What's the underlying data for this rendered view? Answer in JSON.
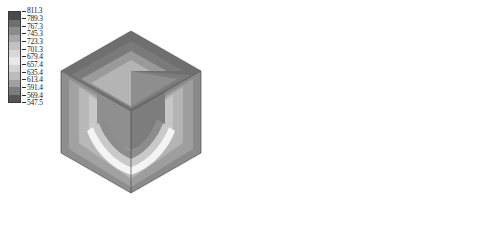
{
  "figure": {
    "kind": "fem-contour-cube-pair",
    "background": "#ffffff"
  },
  "panels": [
    {
      "id": "left",
      "name": "temperature-contour-cube",
      "colorbar": {
        "name": "temperature-colorbar",
        "orientation": "vertical",
        "labels": [
          "811.3",
          "789.3",
          "767.3",
          "745.3",
          "723.3",
          "701.3",
          "679.4",
          "657.4",
          "635.4",
          "613.4",
          "591.4",
          "569.4",
          "547.5"
        ],
        "swatches": [
          "#4a4a4a",
          "#6e6e6e",
          "#8c8c8c",
          "#a8a8a8",
          "#c2c2c2",
          "#d8d8d8",
          "#e8e8e8",
          "#d2d2d2",
          "#bcbcbc",
          "#a0a0a0",
          "#7c7c7c",
          "#565656"
        ],
        "min": "547.5",
        "max": "811.3"
      }
    },
    {
      "id": "right",
      "name": "stress-contour-cube",
      "colorbar": {
        "name": "stress-colorbar",
        "orientation": "vertical",
        "labels": [
          {
            "mantissa": "8.7",
            "exp": "7"
          },
          {
            "mantissa": "8.0",
            "exp": "7"
          },
          {
            "mantissa": "7.3",
            "exp": "7"
          },
          {
            "mantissa": "6.6",
            "exp": "7"
          },
          {
            "mantissa": "5.9",
            "exp": "7"
          },
          {
            "mantissa": "5.2",
            "exp": "7"
          },
          {
            "mantissa": "4.5",
            "exp": "7"
          },
          {
            "mantissa": "3.8",
            "exp": "7"
          },
          {
            "mantissa": "3.1",
            "exp": "7"
          },
          {
            "mantissa": "2.4",
            "exp": "7"
          },
          {
            "mantissa": "1.7",
            "exp": "7"
          },
          {
            "mantissa": "9.9",
            "exp": "6"
          },
          {
            "mantissa": "2.9",
            "exp": "6"
          }
        ],
        "multiply_symbol": "×",
        "base": "10",
        "swatches": [
          "#555555",
          "#767676",
          "#949494",
          "#aeaeae",
          "#c6c6c6",
          "#dcdcdc",
          "#ececec",
          "#d6d6d6",
          "#bdbdbd",
          "#9e9e9e",
          "#7a7a7a",
          "#5a5a5a"
        ],
        "min": "2.9",
        "max": "8.7"
      }
    }
  ],
  "chart_data": {
    "type": "heatmap",
    "title": "",
    "xlabel": "",
    "ylabel": "",
    "subplots": [
      {
        "name": "temperature-contour-cube",
        "geometry": "cube-with-octant-removed",
        "colormap": "grayscale-banded",
        "units_note": "",
        "legend_position": "upper-left",
        "levels": [
          547.5,
          569.4,
          591.4,
          613.4,
          635.4,
          657.4,
          679.4,
          701.3,
          723.3,
          745.3,
          767.3,
          789.3,
          811.3
        ],
        "range": [
          547.5,
          811.3
        ],
        "band_count": 12
      },
      {
        "name": "stress-contour-cube",
        "geometry": "cube-with-octant-removed",
        "colormap": "grayscale-banded",
        "units_note": "",
        "legend_position": "upper-left",
        "levels": [
          2900000,
          9900000,
          17000000,
          24000000,
          31000000,
          38000000,
          45000000,
          52000000,
          59000000,
          66000000,
          73000000,
          80000000,
          87000000
        ],
        "range": [
          2900000,
          87000000
        ],
        "band_count": 12
      }
    ],
    "grid": false
  }
}
